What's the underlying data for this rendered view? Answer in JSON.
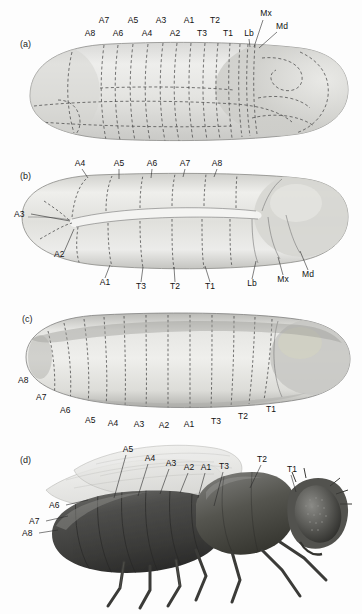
{
  "figure": {
    "background_color": "#fdfdfd",
    "ink_color": "#1c1c1c",
    "panel_count": 4
  },
  "panels": [
    {
      "id": "a",
      "letter": "(a)",
      "stage": "cellular blastoderm fate map",
      "top_row_labels": [
        "A7",
        "A5",
        "A3",
        "A1",
        "T2"
      ],
      "bottom_row_labels": [
        "A8",
        "A6",
        "A4",
        "A2",
        "T3",
        "T1"
      ],
      "head_labels": [
        "Lb",
        "Mx",
        "Md"
      ]
    },
    {
      "id": "b",
      "letter": "(b)",
      "stage": "extended germ band",
      "top_labels": [
        "A4",
        "A5",
        "A6",
        "A7",
        "A8"
      ],
      "left_labels": [
        "A3",
        "A2"
      ],
      "bottom_labels": [
        "A1",
        "T3",
        "T2",
        "T1",
        "Lb",
        "Mx",
        "Md"
      ]
    },
    {
      "id": "c",
      "letter": "(c)",
      "stage": "retracted germ band",
      "arc_labels": [
        "A8",
        "A7",
        "A6",
        "A5",
        "A4",
        "A3",
        "A2",
        "A1",
        "T3",
        "T2",
        "T1"
      ]
    },
    {
      "id": "d",
      "letter": "(d)",
      "stage": "adult fly",
      "top_labels": [
        "A5",
        "A4",
        "A3",
        "A2",
        "A1",
        "T3",
        "T2",
        "T1"
      ],
      "left_labels": [
        "A6",
        "A7",
        "A8"
      ]
    }
  ]
}
